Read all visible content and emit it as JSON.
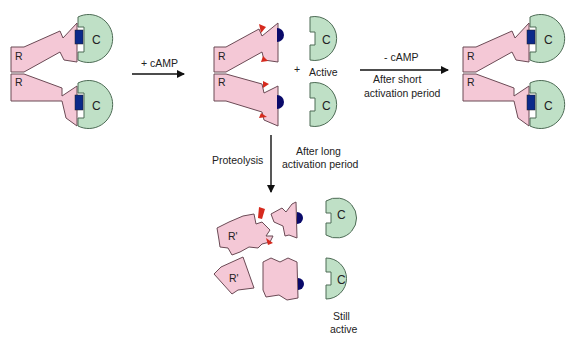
{
  "diagram": {
    "colors": {
      "regulatory_subunit": "#f4c8d6",
      "catalytic_subunit": "#bfe0c6",
      "pseudosubstrate_block": "#0b2a8a",
      "camp": "#0a0a6a",
      "camp_site_marker": "#d62a1e"
    },
    "nodes": {
      "holoenzyme_left": {
        "r_top": "R",
        "r_bottom": "R",
        "c_top": "C",
        "c_bottom": "C"
      },
      "activated": {
        "r_top": "R",
        "r_bottom": "R",
        "c_top": "C",
        "c_bottom": "C",
        "plus": "+",
        "active_label": "Active"
      },
      "holoenzyme_right": {
        "r_top": "R",
        "r_bottom": "R",
        "c_top": "C",
        "c_bottom": "C"
      },
      "proteolyzed": {
        "r_top": "R'",
        "r_bottom": "R'",
        "c_top": "C",
        "c_bottom": "C",
        "still_active_1": "Still",
        "still_active_2": "active"
      }
    },
    "edges": {
      "add_camp": {
        "label": "+ cAMP"
      },
      "remove_camp": {
        "label": "- cAMP",
        "note_1": "After short",
        "note_2": "activation period"
      },
      "proteolysis": {
        "label": "Proteolysis",
        "note_1": "After long",
        "note_2": "activation period"
      }
    }
  }
}
